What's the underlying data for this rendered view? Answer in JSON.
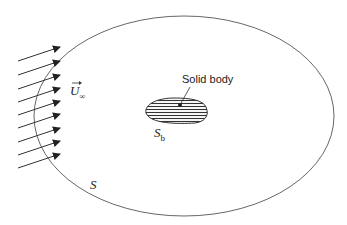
{
  "diagram": {
    "labels": {
      "free_stream": "U",
      "free_stream_sub": "∞",
      "solid_body": "Solid body",
      "body_surface": "S",
      "body_surface_sub": "b",
      "control_surface": "S"
    },
    "colors": {
      "line": "#555555",
      "text": "#222222",
      "hatch": "#333333"
    },
    "arrows": {
      "count": 9,
      "tip_y": [
        47,
        61,
        75,
        88,
        101,
        114,
        128,
        141,
        154
      ]
    }
  }
}
